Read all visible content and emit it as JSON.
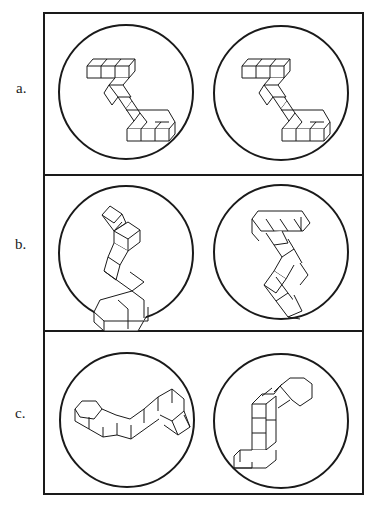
{
  "figure": {
    "rows": [
      {
        "label": "a.",
        "left": {
          "cubes": 10,
          "shape": "zigzag polycube, top arm of 3 cubes, diagonal spine, bottom arm of 3 cubes"
        },
        "right": {
          "cubes": 10,
          "shape": "same zigzag polycube, nearly identical orientation"
        }
      },
      {
        "label": "b.",
        "left": {
          "cubes": 10,
          "shape": "vertical zigzag polycube, bottom arm of 3 cubes"
        },
        "right": {
          "cubes": 10,
          "shape": "vertical zigzag polycube, top arm of 3 cubes"
        }
      },
      {
        "label": "c.",
        "left": {
          "cubes": 10,
          "shape": "horizontal S-shaped polycube"
        },
        "right": {
          "cubes": 10,
          "shape": "vertical S-shaped polycube"
        }
      }
    ]
  },
  "colors": {
    "stroke": "#1a1a1a",
    "background": "#ffffff"
  }
}
